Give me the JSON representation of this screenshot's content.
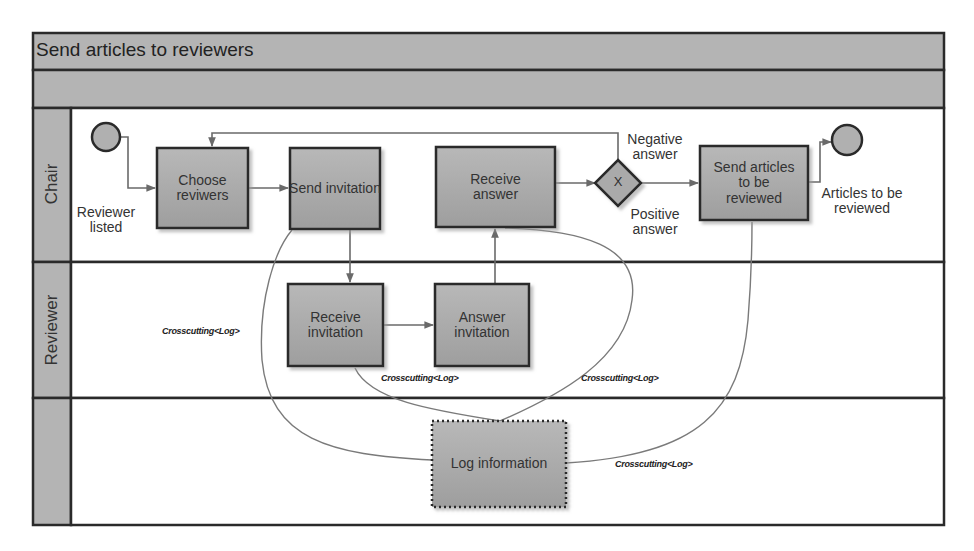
{
  "pool": {
    "title": "Send articles to reviewers",
    "lanes": [
      {
        "id": "chair",
        "label": "Chair"
      },
      {
        "id": "reviewer",
        "label": "Reviewer"
      },
      {
        "id": "log",
        "label": ""
      }
    ]
  },
  "events": {
    "start": {
      "label_line1": "Reviewer",
      "label_line2": "listed"
    },
    "end": {
      "label_line1": "Articles to be",
      "label_line2": "reviewed"
    }
  },
  "tasks": {
    "choose_reviewers": {
      "line1": "Choose",
      "line2": "reviwers"
    },
    "send_invitation": {
      "line1": "Send invitation",
      "line2": ""
    },
    "receive_answer": {
      "line1": "Receive",
      "line2": "answer"
    },
    "send_articles": {
      "line1": "Send articles",
      "line2": "to be",
      "line3": "reviewed"
    },
    "receive_invitation": {
      "line1": "Receive",
      "line2": "invitation"
    },
    "answer_invitation": {
      "line1": "Answer",
      "line2": "invitation"
    },
    "log_information": {
      "line1": "Log information"
    }
  },
  "gateway": {
    "symbol": "X",
    "negative_line1": "Negative",
    "negative_line2": "answer",
    "positive_line1": "Positive",
    "positive_line2": "answer"
  },
  "crosscutting": {
    "label_1": "Crosscutting<Log>",
    "label_2": "Crosscutting<Log>",
    "label_3": "Crosscutting<Log>",
    "label_4": "Crosscutting<Log>"
  },
  "colors": {
    "lane_header": "#b4b4b4",
    "task_fill": "#aaaaaa",
    "border": "#2a2a2a",
    "connector": "#6a6a6a"
  }
}
